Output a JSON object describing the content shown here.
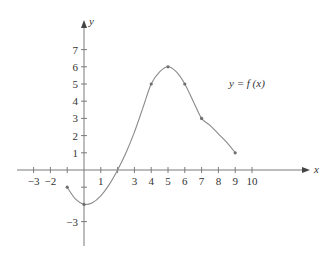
{
  "chart_data": {
    "type": "line",
    "title": "",
    "xlabel": "x",
    "ylabel": "y",
    "curve_label": "y = f (x)",
    "xlim": [
      -3.5,
      11.5
    ],
    "ylim": [
      -4.3,
      8.5
    ],
    "x_ticks": [
      -3,
      -2,
      -1,
      0,
      1,
      2,
      3,
      4,
      5,
      6,
      7,
      8,
      9,
      10
    ],
    "x_tick_labels": [
      "−3",
      "−2",
      "",
      "",
      "1",
      "",
      "3",
      "4",
      "5",
      "6",
      "7",
      "8",
      "9",
      "10"
    ],
    "y_ticks": [
      -3,
      -1,
      1,
      2,
      3,
      4,
      5,
      6,
      7
    ],
    "y_tick_labels": [
      "−3",
      "",
      "1",
      "2",
      "3",
      "4",
      "5",
      "6",
      "7"
    ],
    "grid": false,
    "marked_points": [
      {
        "x": -1,
        "y": -1
      },
      {
        "x": 0,
        "y": -2
      },
      {
        "x": 4,
        "y": 5
      },
      {
        "x": 5,
        "y": 6
      },
      {
        "x": 6,
        "y": 5
      },
      {
        "x": 7,
        "y": 3
      },
      {
        "x": 9,
        "y": 1
      }
    ],
    "curve": {
      "x": [
        -1,
        -0.5,
        0,
        0.5,
        1,
        1.5,
        2,
        2.5,
        3,
        3.5,
        4,
        4.5,
        5,
        5.5,
        6,
        6.5,
        7,
        7.5,
        8,
        8.5,
        9
      ],
      "y": [
        -1,
        -1.7,
        -2,
        -1.9,
        -1.5,
        -0.85,
        0,
        1,
        2.2,
        3.6,
        5,
        5.7,
        6,
        5.7,
        5,
        4,
        3,
        2.6,
        2.1,
        1.6,
        1
      ]
    }
  }
}
